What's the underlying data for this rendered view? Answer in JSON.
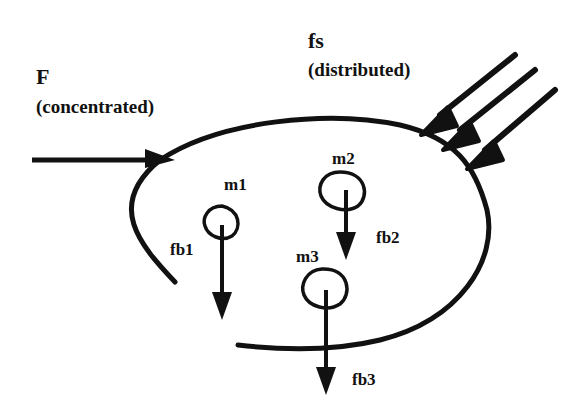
{
  "diagram": {
    "type": "free-body diagram",
    "colors": {
      "ink": "#111111",
      "background": "#ffffff"
    },
    "labels": {
      "F": "F",
      "F_desc": "(concentrated)",
      "fs": "fs",
      "fs_desc": "(distributed)",
      "m1": "m1",
      "m2": "m2",
      "m3": "m3",
      "fb1": "fb1",
      "fb2": "fb2",
      "fb3": "fb3"
    },
    "elements": [
      {
        "id": "body-outline",
        "kind": "open closed-curve boundary"
      },
      {
        "id": "F",
        "kind": "concentrated force arrow",
        "direction": "right",
        "label": "F (concentrated)"
      },
      {
        "id": "fs",
        "kind": "distributed force arrows",
        "count": 3,
        "direction": "down-left",
        "label": "fs (distributed)"
      },
      {
        "id": "m1",
        "kind": "mass element",
        "body_force": "fb1"
      },
      {
        "id": "m2",
        "kind": "mass element",
        "body_force": "fb2"
      },
      {
        "id": "m3",
        "kind": "mass element",
        "body_force": "fb3"
      }
    ]
  }
}
